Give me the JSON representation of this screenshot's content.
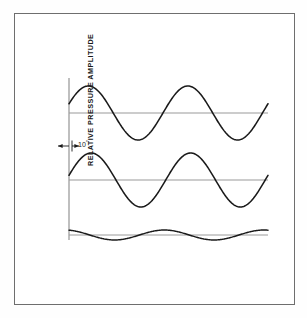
{
  "figure": {
    "y_axis_title": "RELATIVE PRESSURE AMPLITUDE",
    "annotation_value": "10",
    "annotation_unit": "°",
    "border_color": "#6e6e6e",
    "curve_color": "#1a1a1a",
    "baseline_color": "#9a9a9a",
    "axis_color": "#8a8a8a",
    "background_color": "#ffffff"
  },
  "chart_data": {
    "type": "line",
    "title": "",
    "xlabel": "",
    "ylabel": "RELATIVE PRESSURE AMPLITUDE",
    "grid": false,
    "legend": "none",
    "annotations": [
      {
        "text": "10°",
        "meaning": "phase-offset-between-upper-and-middle-wave",
        "x_px": 78,
        "y_px": 142
      }
    ],
    "axes": [
      {
        "name": "upper-panel",
        "baseline_y_px": 113,
        "x_start_px": 69,
        "x_end_px": 268
      },
      {
        "name": "middle-panel",
        "baseline_y_px": 180,
        "x_start_px": 69,
        "x_end_px": 268
      },
      {
        "name": "lower-panel",
        "baseline_y_px": 235,
        "x_start_px": 69,
        "x_end_px": 268
      }
    ],
    "series": [
      {
        "name": "wave-1",
        "panel": "upper-panel",
        "waveform": "sine",
        "amplitude": 27,
        "cycles": 2,
        "phase_deg": 20,
        "x": [
          0,
          0.0625,
          0.125,
          0.1875,
          0.25,
          0.3125,
          0.375,
          0.4375,
          0.5,
          0.5625,
          0.625,
          0.6875,
          0.75,
          0.8125,
          0.875,
          0.9375,
          1
        ],
        "values": [
          9.23,
          21.85,
          26.68,
          22.86,
          11.75,
          -2.78,
          -16.0,
          -24.61,
          -26.97,
          -22.82,
          -12.85,
          0.0,
          12.85,
          22.82,
          26.97,
          24.61,
          16.0
        ]
      },
      {
        "name": "wave-2",
        "panel": "middle-panel",
        "waveform": "sine",
        "amplitude": 27,
        "cycles": 2,
        "phase_deg": 10,
        "x": [
          0,
          0.0625,
          0.125,
          0.1875,
          0.25,
          0.3125,
          0.375,
          0.4375,
          0.5,
          0.5625,
          0.625,
          0.6875,
          0.75,
          0.8125,
          0.875,
          0.9375,
          1
        ],
        "values": [
          4.69,
          18.73,
          25.7,
          24.61,
          15.57,
          1.88,
          -11.75,
          -22.03,
          -26.6,
          -24.05,
          -15.57,
          -3.29,
          9.23,
          19.86,
          26.28,
          26.6,
          20.67
        ]
      },
      {
        "name": "wave-difference",
        "panel": "lower-panel",
        "waveform": "difference",
        "amplitude": 5,
        "cycles": 2,
        "x": [
          0,
          0.0625,
          0.125,
          0.1875,
          0.25,
          0.3125,
          0.375,
          0.4375,
          0.5,
          0.5625,
          0.625,
          0.6875,
          0.75,
          0.8125,
          0.875,
          0.9375,
          1
        ],
        "values": [
          4.54,
          3.12,
          0.98,
          -1.75,
          -3.82,
          -4.66,
          -4.25,
          -2.58,
          -0.37,
          1.23,
          2.72,
          3.29,
          3.62,
          2.96,
          0.69,
          -1.99,
          -4.67
        ]
      }
    ]
  }
}
